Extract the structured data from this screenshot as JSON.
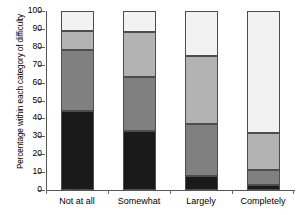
{
  "chart_data": {
    "type": "bar",
    "subtype": "stacked-100-percent",
    "title": "",
    "xlabel": "",
    "ylabel": "Percentage within each category of difficulty",
    "ylim": [
      0,
      100
    ],
    "yticks": [
      0,
      10,
      20,
      30,
      40,
      50,
      60,
      70,
      80,
      90,
      100
    ],
    "grid": false,
    "legend": "none",
    "categories": [
      "Not at all",
      "Somewhat",
      "Largely",
      "Completely"
    ],
    "series": [
      {
        "name": "black",
        "color": "#1a1a1a",
        "values": [
          44,
          33,
          8,
          3
        ]
      },
      {
        "name": "dark-grey",
        "color": "#808080",
        "values": [
          34,
          30,
          29,
          8
        ]
      },
      {
        "name": "mid-grey",
        "color": "#b3b3b3",
        "values": [
          11,
          25,
          38,
          21
        ]
      },
      {
        "name": "white",
        "color": "#f2f2f2",
        "values": [
          11,
          12,
          25,
          68
        ]
      }
    ],
    "segment_boundaries": {
      "Not at all": [
        44,
        78,
        89,
        100
      ],
      "Somewhat": [
        33,
        63,
        88,
        100
      ],
      "Largely": [
        8,
        37,
        75,
        100
      ],
      "Completely": [
        3,
        11,
        32,
        100
      ]
    }
  },
  "axis": {
    "y_tick_labels": [
      "0",
      "10",
      "20",
      "30",
      "40",
      "50",
      "60",
      "70",
      "80",
      "90",
      "100"
    ],
    "y_title": "Percentage within each category of difficulty"
  }
}
